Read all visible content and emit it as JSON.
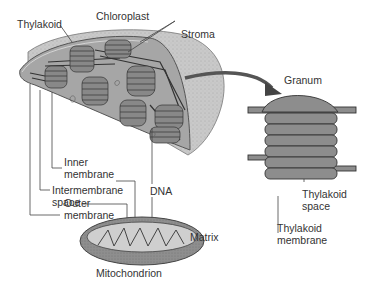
{
  "diagram": {
    "type": "labeled-illustration",
    "colors": {
      "outer_membrane": "#b8b8b8",
      "stroma": "#a8a8a8",
      "thylakoid_fill": "#8a8a8a",
      "thylakoid_edge": "#3a3a3a",
      "mitochondrion_outer": "#8c8c8c",
      "matrix": "#cfcfcf",
      "text": "#333333",
      "arrow": "#555555"
    },
    "chloroplast": {
      "title": "Chloroplast",
      "labels": {
        "thylakoid": "Thylakoid",
        "stroma": "Stroma",
        "inner_membrane_1": "Inner",
        "inner_membrane_2": "membrane",
        "intermembrane_1": "Intermembrane",
        "intermembrane_2": "space",
        "outer_membrane_1": "Outer",
        "outer_membrane_2": "membrane",
        "dna": "DNA"
      }
    },
    "granum": {
      "title": "Granum",
      "labels": {
        "thylakoid_space_1": "Thylakoid",
        "thylakoid_space_2": "space",
        "thylakoid_membrane_1": "Thylakoid",
        "thylakoid_membrane_2": "membrane"
      }
    },
    "mitochondrion": {
      "title": "Mitochondrion",
      "labels": {
        "matrix": "Matrix"
      }
    }
  }
}
